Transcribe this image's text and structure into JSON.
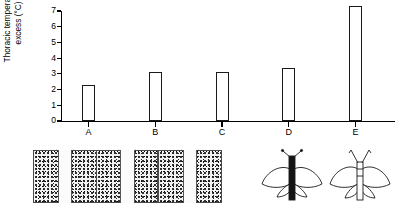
{
  "chart_data": {
    "type": "bar",
    "title": "",
    "xlabel": "",
    "ylabel": "Thoracic temperature\nexcess (°C)",
    "categories": [
      "A",
      "B",
      "C",
      "D",
      "E"
    ],
    "values": [
      2.3,
      3.1,
      3.1,
      3.4,
      7.3
    ],
    "ylim": [
      0,
      7
    ],
    "yticks": [
      0,
      1,
      2,
      3,
      4,
      5,
      6,
      7
    ],
    "ytick_labels": [
      "0",
      "1",
      "2",
      "3",
      "4",
      "5",
      "6",
      "7"
    ],
    "grid": false,
    "legend": false,
    "bar_fill": "#ffffff",
    "bar_edge": "#1a1a1a",
    "axis_color": "#000000"
  },
  "axis": {
    "y_label_line1": "Thoracic temperature",
    "y_label_line2": "excess (°C)",
    "tick_labels": [
      "7",
      "6",
      "5",
      "4",
      "3",
      "2",
      "1",
      "0"
    ],
    "category_labels": [
      "A",
      "B",
      "C",
      "D",
      "E"
    ]
  },
  "specimens": {
    "caption": "",
    "items": [
      {
        "id": "A",
        "name": "specimen-a",
        "wing_color": "#111111",
        "background": "speckled-panel",
        "description": "dark-winged butterfly on speckled background with pale vertical band"
      },
      {
        "id": "B",
        "name": "specimen-b",
        "wing_color": "#111111",
        "background": "speckled-panel",
        "description": "dark-winged butterfly on speckled background with pale vertical band"
      },
      {
        "id": "C",
        "name": "specimen-c",
        "wing_color": "#111111",
        "background": "speckled-panel",
        "description": "dark-winged butterfly on speckled background with pale vertical band"
      },
      {
        "id": "D",
        "name": "specimen-d",
        "wing_color": "#ffffff",
        "background": "plain-white",
        "description": "pale outline butterfly with dark body"
      },
      {
        "id": "E",
        "name": "specimen-e",
        "wing_color": "#ffffff",
        "background": "plain-white",
        "description": "pale outline butterfly with pale body"
      }
    ]
  }
}
